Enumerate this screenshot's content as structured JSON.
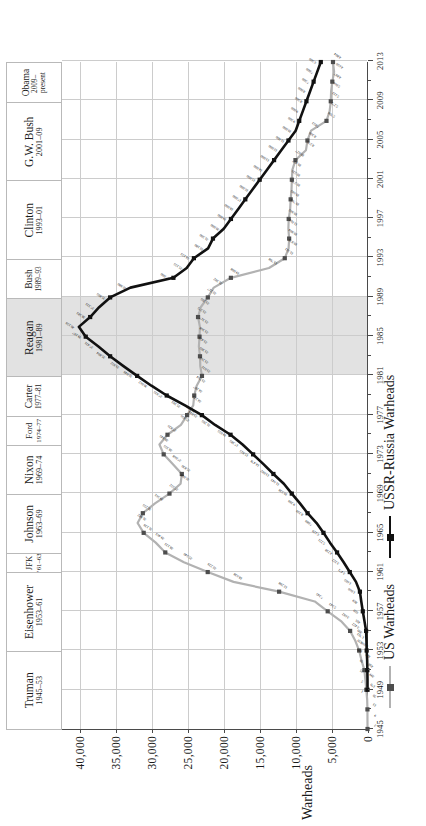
{
  "chart_data": {
    "type": "line",
    "title": "",
    "xlabel": "",
    "ylabel": "Warheads",
    "ylim": [
      0,
      42500
    ],
    "xlim": [
      1945,
      2013
    ],
    "grid": true,
    "legend_position": "bottom-left",
    "x_ticks": [
      1945,
      1949,
      1953,
      1957,
      1961,
      1965,
      1969,
      1973,
      1977,
      1981,
      1985,
      1989,
      1993,
      1997,
      2001,
      2005,
      2009,
      2013
    ],
    "y_ticks": [
      0,
      5000,
      10000,
      15000,
      20000,
      25000,
      30000,
      35000,
      40000
    ],
    "y_tick_labels": [
      "0",
      "5,000",
      "10,000",
      "15,000",
      "20,000",
      "25,000",
      "30,000",
      "35,000",
      "40,000"
    ],
    "shaded_span": {
      "label": "Reagan 1981-89",
      "from": 1981,
      "to": 1989,
      "color": "#e2e2e2"
    },
    "series": [
      {
        "name": "US Warheads",
        "color": "#b2b2b2",
        "marker": "square",
        "marker_color": "#4d4d4d",
        "x": [
          1945,
          1946,
          1947,
          1948,
          1949,
          1950,
          1951,
          1952,
          1953,
          1954,
          1955,
          1956,
          1957,
          1958,
          1959,
          1960,
          1961,
          1962,
          1963,
          1964,
          1965,
          1966,
          1967,
          1968,
          1969,
          1970,
          1971,
          1972,
          1973,
          1974,
          1975,
          1976,
          1977,
          1978,
          1979,
          1980,
          1981,
          1982,
          1983,
          1984,
          1985,
          1986,
          1987,
          1988,
          1989,
          1990,
          1991,
          1992,
          1993,
          1994,
          1995,
          1996,
          1997,
          1998,
          1999,
          2000,
          2001,
          2002,
          2003,
          2004,
          2005,
          2006,
          2007,
          2008,
          2009,
          2010,
          2011,
          2012,
          2013
        ],
        "y": [
          2,
          9,
          13,
          50,
          170,
          299,
          438,
          841,
          1169,
          1703,
          2422,
          3692,
          5543,
          7345,
          12298,
          18638,
          22229,
          25540,
          28133,
          29463,
          31139,
          31982,
          31255,
          29561,
          27552,
          26008,
          25830,
          27068,
          28355,
          28945,
          27826,
          25956,
          25099,
          24243,
          24107,
          23764,
          23031,
          23265,
          23305,
          23459,
          23368,
          23317,
          23575,
          23205,
          22217,
          21392,
          19008,
          13708,
          11511,
          10979,
          10904,
          11011,
          10965,
          10763,
          10695,
          10577,
          10526,
          10457,
          10027,
          8570,
          8360,
          7853,
          5709,
          5273,
          5113,
          5066,
          4897,
          4650,
          4804
        ],
        "data_labels_shown": true
      },
      {
        "name": "USSR-Russia Warheads",
        "color": "#111111",
        "marker": "square",
        "marker_color": "#111111",
        "x": [
          1949,
          1950,
          1951,
          1952,
          1953,
          1954,
          1955,
          1956,
          1957,
          1958,
          1959,
          1960,
          1961,
          1962,
          1963,
          1964,
          1965,
          1966,
          1967,
          1968,
          1969,
          1970,
          1971,
          1972,
          1973,
          1974,
          1975,
          1976,
          1977,
          1978,
          1979,
          1980,
          1981,
          1982,
          1983,
          1984,
          1985,
          1986,
          1987,
          1988,
          1989,
          1990,
          1991,
          1992,
          1993,
          1994,
          1995,
          1996,
          1997,
          1998,
          1999,
          2000,
          2001,
          2002,
          2003,
          2004,
          2005,
          2006,
          2007,
          2008,
          2009,
          2010,
          2011,
          2012,
          2013
        ],
        "y": [
          1,
          5,
          25,
          50,
          120,
          150,
          200,
          426,
          660,
          869,
          1060,
          1605,
          2471,
          3322,
          4238,
          5221,
          6129,
          7089,
          8339,
          9399,
          10538,
          11643,
          13092,
          14478,
          15915,
          17385,
          19055,
          21205,
          23044,
          25393,
          27935,
          30062,
          32049,
          33952,
          35804,
          37431,
          39197,
          40159,
          38583,
          37333,
          35805,
          32980,
          27000,
          25155,
          24153,
          22180,
          21500,
          20000,
          19000,
          18000,
          17000,
          16000,
          15000,
          14000,
          13000,
          12000,
          11000,
          10000,
          9500,
          9000,
          8500,
          8000,
          7500,
          7000,
          6500
        ],
        "data_labels_shown": true
      }
    ],
    "annotated_values": {
      "us_peak": {
        "year": 1966,
        "value": 31982
      },
      "ussr_peak": {
        "year": 1986,
        "value": 40159
      },
      "us_labels": [
        "2",
        "9",
        "13",
        "50",
        "170",
        "299",
        "438",
        "841",
        "1,169",
        "1,703",
        "2,422",
        "3,692",
        "5,543",
        "7,345",
        "12,298",
        "18,638",
        "22,229",
        "25,540",
        "28,133",
        "29,463",
        "31,139",
        "31,982",
        "31,255",
        "29,561",
        "27,552",
        "26,008",
        "25,830",
        "27,068",
        "28,355",
        "28,945",
        "27,826",
        "25,956",
        "25,099",
        "24,243",
        "24,107",
        "23,764",
        "23,031",
        "23,265",
        "23,305",
        "23,459",
        "23,368",
        "23,317",
        "23,575",
        "23,205",
        "22,217",
        "21,392",
        "19,008",
        "13,708",
        "11,511",
        "10,979",
        "10,904",
        "11,011",
        "10,965",
        "10,763",
        "10,695",
        "10,577",
        "10,526",
        "10,457",
        "10,027",
        "8,570",
        "8,360",
        "7,853",
        "5,709",
        "5,273",
        "5,113",
        "5,066",
        "4,897",
        "4,650",
        "4,804"
      ],
      "ussr_labels": [
        "1",
        "5",
        "25",
        "50",
        "120",
        "150",
        "200",
        "426",
        "660",
        "869",
        "1,060",
        "1,605",
        "2,471",
        "3,322",
        "4,238",
        "5,221",
        "6,129",
        "7,089",
        "8,339",
        "9,399",
        "10,538",
        "11,643",
        "13,092",
        "14,478",
        "15,915",
        "17,385",
        "19,055",
        "21,205",
        "23,044",
        "25,393",
        "27,935",
        "30,062",
        "32,049",
        "33,952",
        "35,804",
        "37,431",
        "39,197",
        "40,159",
        "38,583",
        "37,333",
        "35,805",
        "32,980",
        "27,000",
        "25,155",
        "24,153",
        "22,180",
        "21,500",
        "20,000",
        "19,000",
        "18,000",
        "17,000",
        "16,000",
        "15,000",
        "14,000",
        "13,000",
        "12,000",
        "11,000",
        "10,000",
        "9,500",
        "9,000",
        "8,500",
        "8,000",
        "7,500",
        "7,000",
        "6,500"
      ]
    }
  },
  "presidents": [
    {
      "name": "Truman",
      "years": "1945–53",
      "from": 1945,
      "to": 1953,
      "shaded": false
    },
    {
      "name": "Eisenhower",
      "years": "1953–61",
      "from": 1953,
      "to": 1961,
      "shaded": false
    },
    {
      "name": "JFK",
      "years": "’61–63",
      "from": 1961,
      "to": 1963,
      "shaded": false
    },
    {
      "name": "Johnson",
      "years": "1963–69",
      "from": 1963,
      "to": 1969,
      "shaded": false
    },
    {
      "name": "Nixon",
      "years": "1969–74",
      "from": 1969,
      "to": 1974,
      "shaded": false
    },
    {
      "name": "Ford",
      "years": "1974–77",
      "from": 1974,
      "to": 1977,
      "shaded": false
    },
    {
      "name": "Carter",
      "years": "1977–81",
      "from": 1977,
      "to": 1981,
      "shaded": false
    },
    {
      "name": "Reagan",
      "years": "1981–89",
      "from": 1981,
      "to": 1989,
      "shaded": true
    },
    {
      "name": "Bush",
      "years": "1989–93",
      "from": 1989,
      "to": 1993,
      "shaded": false
    },
    {
      "name": "Clinton",
      "years": "1993–01",
      "from": 1993,
      "to": 2001,
      "shaded": false
    },
    {
      "name": "G.W. Bush",
      "years": "2001–09",
      "from": 2001,
      "to": 2009,
      "shaded": false
    },
    {
      "name": "Obama",
      "years": "2009–\npresent",
      "from": 2009,
      "to": 2013,
      "shaded": false
    }
  ],
  "axis": {
    "y_title": "Warheads"
  },
  "legend": {
    "items": [
      {
        "label": "US Warheads",
        "color": "#b2b2b2",
        "marker_color": "#4d4d4d"
      },
      {
        "label": "USSR-Russia Warheads",
        "color": "#111111",
        "marker_color": "#111111"
      }
    ]
  }
}
